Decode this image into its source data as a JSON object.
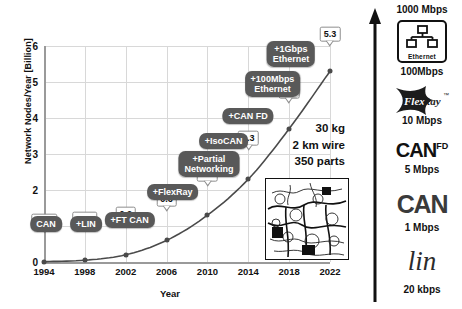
{
  "chart_data": {
    "type": "line",
    "title": "",
    "xlabel": "Year",
    "ylabel": "Network Nodes/Year [Billion]",
    "xlim": [
      1994,
      2022
    ],
    "ylim": [
      0,
      6
    ],
    "grid": true,
    "legend": "none",
    "x": [
      1994,
      1998,
      2002,
      2006,
      2010,
      2014,
      2018,
      2022
    ],
    "xtick_labels": [
      "1994",
      "1998",
      "2002",
      "2006",
      "2010",
      "2014",
      "2018",
      "2022"
    ],
    "ytick_labels": [
      "0",
      "1",
      "2",
      "3",
      "4",
      "5",
      "6"
    ],
    "ytick_values": [
      0,
      1,
      2,
      3,
      4,
      5,
      6
    ],
    "values": [
      0.01,
      0.05,
      0.2,
      0.6,
      1.3,
      2.3,
      3.7,
      5.3
    ],
    "point_labels": [
      "0.01",
      "0.05",
      "0.2",
      "0.6",
      "1.3",
      "2.3",
      "3.7",
      "5.3"
    ],
    "annotations": [
      {
        "label": "CAN",
        "x": 1994
      },
      {
        "label": "+LIN",
        "x": 1998
      },
      {
        "label": "+FT CAN",
        "x": 2002
      },
      {
        "label": "+FlexRay",
        "x": 2006
      },
      {
        "label": "+Partial\nNetworking",
        "x": 2008
      },
      {
        "label": "+IsoCAN",
        "x": 2011
      },
      {
        "label": "+CAN FD",
        "x": 2013
      },
      {
        "label": "+100Mbps\nEthernet",
        "x": 2015
      },
      {
        "label": "+1Gbps\nEthernet",
        "x": 2017
      }
    ],
    "callout": [
      "30 kg",
      "2 km wire",
      "350 parts"
    ]
  },
  "chart": {
    "ylabel": "Network Nodes/Year [Billion]",
    "xlabel": "Year"
  },
  "callout": {
    "line1": "30 kg",
    "line2": "2 km wire",
    "line3": "350 parts"
  },
  "speed_panel": {
    "top_label": "1000 Mbps",
    "items": [
      {
        "logo_text": "Ethernet",
        "speed": "100Mbps",
        "icon": "ethernet-icon"
      },
      {
        "logo_text": "FlexRay",
        "speed": "10 Mbps",
        "icon": "flexray-logo"
      },
      {
        "logo_text": "CAN",
        "logo_sup": "FD",
        "speed": "5 Mbps",
        "icon": "canfd-logo"
      },
      {
        "logo_text": "CAN",
        "speed": "1 Mbps",
        "icon": "can-logo"
      },
      {
        "logo_text": "lin",
        "speed": "20 kbps",
        "icon": "lin-logo"
      }
    ]
  },
  "colors": {
    "pill": "#595959",
    "grid": "#d8d8d8",
    "axis": "#9a9a9a",
    "curve": "#4a4a4a",
    "text": "#111111"
  }
}
